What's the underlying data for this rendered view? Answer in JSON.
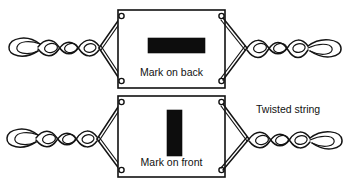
{
  "figure": {
    "background_color": "#ffffff",
    "ink_color": "#111111",
    "mark_color": "#0d0d0d",
    "width": 350,
    "height": 187
  },
  "labels": {
    "mark_on_back": "Mark on back",
    "mark_on_front": "Mark on front",
    "twisted_string": "Twisted string"
  },
  "panels": [
    {
      "id": "upper",
      "view": "back",
      "card_label": "Mark on back",
      "card": {
        "x": 118,
        "y": 10,
        "width": 107,
        "height": 78
      },
      "mark": {
        "orientation": "horizontal",
        "x": 148,
        "y": 38,
        "width": 57,
        "height": 15,
        "color": "#0d0d0d"
      }
    },
    {
      "id": "lower",
      "view": "front",
      "card_label": "Mark on front",
      "card": {
        "x": 118,
        "y": 96,
        "width": 107,
        "height": 81
      },
      "mark": {
        "orientation": "vertical",
        "x": 167,
        "y": 110,
        "width": 15,
        "height": 46,
        "color": "#0d0d0d"
      }
    }
  ],
  "callouts": [
    {
      "id": "twisted-string-callout",
      "text": "Twisted string",
      "x": 255,
      "y": 110
    }
  ]
}
